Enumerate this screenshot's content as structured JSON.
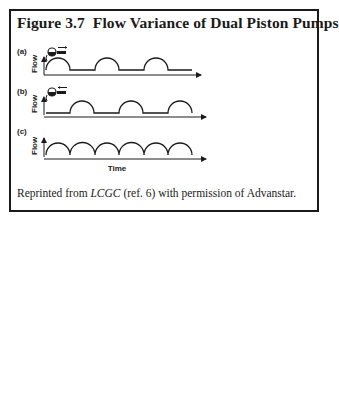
{
  "figure": {
    "title": "Figure 3.7  Flow Variance of Dual Piston Pumps",
    "panels": [
      {
        "label": "(a)",
        "ylabel": "Flow",
        "pump_icon": "piston-forward-icon",
        "description": "single piston pulses separated by flat zero-flow segments"
      },
      {
        "label": "(b)",
        "ylabel": "Flow",
        "pump_icon": "piston-reverse-icon",
        "description": "second piston pulses offset, filling gaps of (a)"
      },
      {
        "label": "(c)",
        "ylabel": "Flow",
        "pump_icon": null,
        "description": "combined continuous flow of six contiguous arcs"
      }
    ],
    "xlabel": "Time",
    "caption": {
      "prefix": "Reprinted from ",
      "journal": "LCGC",
      "suffix": " (ref. 6) with permission of Advanstar."
    }
  },
  "colors": {
    "line": "#1a1a1a",
    "border": "#1a1a1a",
    "background": "#ffffff"
  }
}
